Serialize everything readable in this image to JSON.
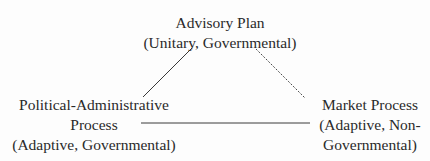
{
  "diagram": {
    "nodes": {
      "top": {
        "title": "Advisory Plan",
        "subtitle": "(Unitary, Governmental)"
      },
      "left": {
        "title": "Political-Administrative",
        "title2": "Process",
        "subtitle": "(Adaptive, Governmental)"
      },
      "right": {
        "title": "Market Process",
        "subtitle": "(Adaptive, Non-",
        "subtitle2": "Governmental)"
      }
    },
    "edges": [
      {
        "from": "top",
        "to": "left",
        "style": "solid"
      },
      {
        "from": "top",
        "to": "right",
        "style": "dashed"
      },
      {
        "from": "left",
        "to": "right",
        "style": "solid"
      }
    ],
    "colors": {
      "line": "#3a3a3a",
      "text": "#2a2a2a",
      "background": "#fdfdfd"
    }
  }
}
